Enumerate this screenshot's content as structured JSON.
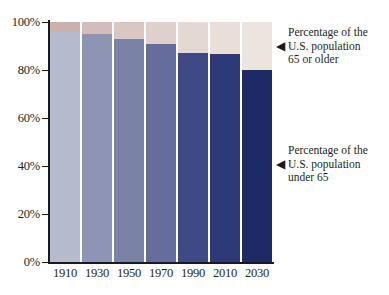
{
  "chart_data": {
    "type": "bar",
    "subtype": "stacked-100-percent",
    "title": "",
    "xlabel": "",
    "ylabel": "",
    "categories": [
      "1910",
      "1930",
      "1950",
      "1970",
      "1990",
      "2010",
      "2030"
    ],
    "ylim": [
      0,
      100
    ],
    "ytick_labels": [
      "0%",
      "20%",
      "40%",
      "60%",
      "80%",
      "100%"
    ],
    "ytick_values": [
      0,
      20,
      40,
      60,
      80,
      100
    ],
    "grid": false,
    "legend_position": "right-annotations",
    "series": [
      {
        "name": "Percentage of the U.S. population under 65",
        "values": [
          96,
          95,
          93,
          91,
          87,
          86.5,
          80
        ],
        "colors": [
          "#b6bacd",
          "#8e95b4",
          "#7a82a6",
          "#646d9c",
          "#3f4a85",
          "#2e3a78",
          "#1d2a63"
        ]
      },
      {
        "name": "Percentage of the U.S. population 65 or older",
        "values": [
          4,
          5,
          7,
          9,
          13,
          13.5,
          20
        ],
        "colors": [
          "#cbb0ae",
          "#d3bcba",
          "#dac6c2",
          "#e0d0cb",
          "#e4d8d2",
          "#e9ded8",
          "#ece4de"
        ]
      }
    ]
  },
  "yaxis": {
    "ticks": [
      {
        "label": "100%",
        "value": 100
      },
      {
        "label": "80%",
        "value": 80
      },
      {
        "label": "60%",
        "value": 60
      },
      {
        "label": "40%",
        "value": 40
      },
      {
        "label": "20%",
        "value": 20
      },
      {
        "label": "0%",
        "value": 0
      }
    ]
  },
  "xaxis": {
    "labels": [
      "1910",
      "1930",
      "1950",
      "1970",
      "1990",
      "2010",
      "2030"
    ]
  },
  "annotations": [
    {
      "id": "older",
      "arrow_icon": "left-triangle-icon",
      "arrow_glyph": "◀",
      "lines": [
        "Percentage of the",
        "U.S. population",
        "65 or older"
      ]
    },
    {
      "id": "under",
      "arrow_icon": "left-triangle-icon",
      "arrow_glyph": "◀",
      "lines": [
        "Percentage of the",
        "U.S. population",
        "under 65"
      ]
    }
  ],
  "colors": {
    "axis": "#1a1a1a",
    "text": "#231f20",
    "background": "#ffffff"
  }
}
